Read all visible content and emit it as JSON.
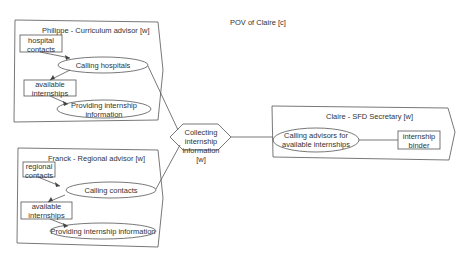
{
  "title": "POV of Claire [c]",
  "groups": {
    "philippe": {
      "label": "Philippe - Curriculum advisor [w]",
      "resource1": "hospital contacts",
      "task1": "Calling hospitals",
      "resource2": "available internships",
      "task2": "Providing internship information"
    },
    "franck": {
      "label": "Franck - Regional advisor [w]",
      "resource1": "regional contacts",
      "task1": "Calling contacts",
      "resource2": "available internships",
      "task2": "Providing internship information"
    },
    "claire": {
      "label": "Claire - SFD Secretary [w]",
      "task1": "Calling advisors for available internships",
      "resource1": "internship binder"
    }
  },
  "central": {
    "label": "Collecting internship information [w]"
  },
  "colors": {
    "stroke": "#555555",
    "text": "#333333",
    "background": "#ffffff"
  }
}
